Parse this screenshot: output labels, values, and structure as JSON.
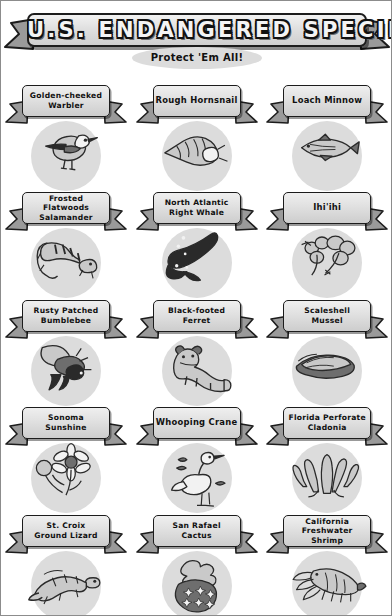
{
  "poster": {
    "title": "U.S. ENDANGERED SPECIES",
    "subtitle": "Protect 'Em All!",
    "accent_dark": "#1c1c1c",
    "plate_light": "#efefef",
    "plate_shade": "#cdcdcd",
    "tail_gray": "#9a9a9a",
    "disc_gray": "#dcdcdc",
    "background": "#ffffff"
  },
  "species": [
    {
      "name": "Golden-cheeked\nWarbler",
      "icon": "warbler-icon",
      "lines": 2
    },
    {
      "name": "Rough Hornsnail",
      "icon": "hornsnail-icon",
      "lines": 1
    },
    {
      "name": "Loach Minnow",
      "icon": "minnow-icon",
      "lines": 1
    },
    {
      "name": "Frosted Flatwoods\nSalamander",
      "icon": "salamander-icon",
      "lines": 2
    },
    {
      "name": "North Atlantic\nRight Whale",
      "icon": "right-whale-icon",
      "lines": 2
    },
    {
      "name": "Ihi'ihi",
      "icon": "ihiihi-plant-icon",
      "lines": 1
    },
    {
      "name": "Rusty Patched\nBumblebee",
      "icon": "bumblebee-icon",
      "lines": 2
    },
    {
      "name": "Black-footed\nFerret",
      "icon": "ferret-icon",
      "lines": 2
    },
    {
      "name": "Scaleshell\nMussel",
      "icon": "mussel-icon",
      "lines": 2
    },
    {
      "name": "Sonoma\nSunshine",
      "icon": "sunshine-flower-icon",
      "lines": 2
    },
    {
      "name": "Whooping Crane",
      "icon": "whooping-crane-icon",
      "lines": 1
    },
    {
      "name": "Florida Perforate\nCladonia",
      "icon": "cladonia-lichen-icon",
      "lines": 2
    },
    {
      "name": "St. Croix\nGround Lizard",
      "icon": "ground-lizard-icon",
      "lines": 2
    },
    {
      "name": "San Rafael\nCactus",
      "icon": "cactus-icon",
      "lines": 2
    },
    {
      "name": "California\nFreshwater Shrimp",
      "icon": "freshwater-shrimp-icon",
      "lines": 2
    }
  ]
}
